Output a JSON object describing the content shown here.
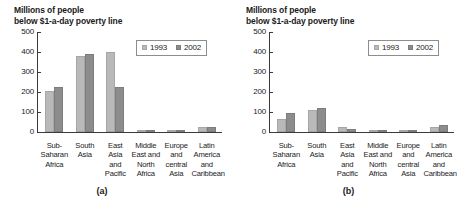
{
  "figure": {
    "panels": [
      {
        "caption": "(a)",
        "title": "Millions of people\nbelow $1-a-day poverty line",
        "legend": {
          "items": [
            "1993",
            "2002"
          ]
        },
        "chart_data": {
          "type": "bar",
          "title": "Millions of people below $1-a-day poverty line",
          "xlabel": "",
          "ylabel": "Millions of people below $1-a-day poverty line",
          "ylim": [
            0,
            500
          ],
          "yticks": [
            0,
            100,
            200,
            300,
            400,
            500
          ],
          "ytick_labels": [
            "0",
            "100",
            "200",
            "300",
            "400",
            "500"
          ],
          "grid": false,
          "legend_position": "top-right",
          "categories": [
            "Sub-\nSaharan\nAfrica",
            "South\nAsia",
            "East\nAsia\nand\nPacific",
            "Middle\nEast and\nNorth\nAfrica",
            "Europe\nand\ncentral\nAsia",
            "Latin\nAmerica\nand\nCaribbean"
          ],
          "series": [
            {
              "name": "1993",
              "color": "#b9b9b9",
              "values": [
                207,
                382,
                398,
                5,
                3,
                27
              ]
            },
            {
              "name": "2002",
              "color": "#8c8c8c",
              "values": [
                224,
                390,
                223,
                7,
                8,
                26
              ]
            }
          ]
        }
      },
      {
        "caption": "(b)",
        "title": "Millions of people\nbelow $1-a-day poverty line",
        "legend": {
          "items": [
            "1993",
            "2002"
          ]
        },
        "chart_data": {
          "type": "bar",
          "title": "Millions of people below $1-a-day poverty line",
          "xlabel": "",
          "ylabel": "Millions of people below $1-a-day poverty line",
          "ylim": [
            0,
            500
          ],
          "yticks": [
            0,
            100,
            200,
            300,
            400,
            500
          ],
          "ytick_labels": [
            "0",
            "100",
            "200",
            "300",
            "400",
            "500"
          ],
          "grid": false,
          "legend_position": "top-right",
          "categories": [
            "Sub-\nSaharan\nAfrica",
            "South\nAsia",
            "East\nAsia\nand\nPacific",
            "Middle\nEast and\nNorth\nAfrica",
            "Europe\nand\ncentral\nAsia",
            "Latin\nAmerica\nand\nCaribbean"
          ],
          "series": [
            {
              "name": "1993",
              "color": "#b9b9b9",
              "values": [
                65,
                108,
                25,
                2,
                2,
                24
              ]
            },
            {
              "name": "2002",
              "color": "#8c8c8c",
              "values": [
                95,
                122,
                13,
                2,
                2,
                33
              ]
            }
          ]
        }
      }
    ]
  }
}
